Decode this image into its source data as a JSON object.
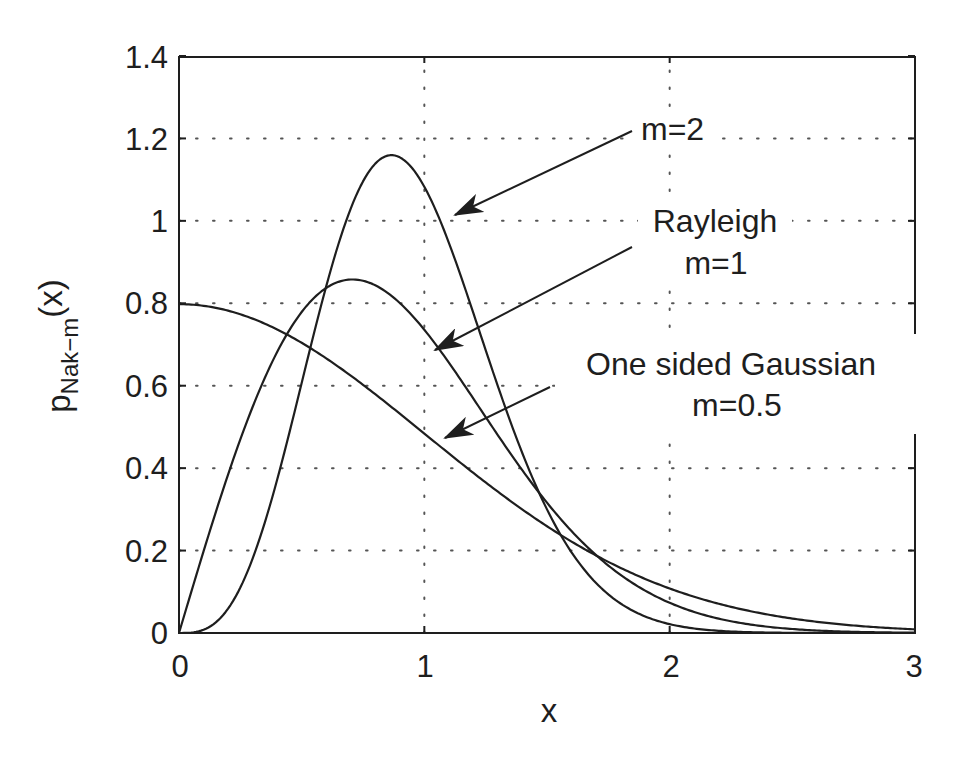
{
  "chart_data": {
    "type": "line",
    "title": "",
    "xlabel": "x",
    "ylabel": "p_Nak-m(x)",
    "ylabel_parts": {
      "main": "p",
      "sub": "Nak−m",
      "arg": "(x)"
    },
    "xlim": [
      0,
      3
    ],
    "ylim": [
      0,
      1.4
    ],
    "xticks": [
      0,
      1,
      2,
      3
    ],
    "xtick_labels": [
      "0",
      "1",
      "2",
      "3"
    ],
    "yticks": [
      0,
      0.2,
      0.4,
      0.6,
      0.8,
      1,
      1.2,
      1.4
    ],
    "ytick_labels": [
      "0",
      "0.2",
      "0.4",
      "0.6",
      "0.8",
      "1",
      "1.2",
      "1.4"
    ],
    "grid": true,
    "grid_style": "dotted",
    "legend": "none (inline annotations with arrows)",
    "line_color": "#1e1e1e",
    "series": [
      {
        "name": "m=2",
        "m": 2,
        "formula": "2*m^m/Gamma(m) * x^(2m-1) * exp(-m*x^2)",
        "x": [
          0,
          0.25,
          0.5,
          0.75,
          0.866,
          1.0,
          1.25,
          1.5,
          1.75,
          2.0,
          2.5,
          3.0
        ],
        "values": [
          0,
          0.11,
          0.607,
          1.115,
          1.159,
          1.083,
          0.696,
          0.3,
          0.084,
          0.015,
          0.0001,
          0.0
        ]
      },
      {
        "name": "Rayleigh m=1",
        "m": 1,
        "formula": "2*x*exp(-x^2)",
        "x": [
          0,
          0.25,
          0.5,
          0.707,
          1.0,
          1.25,
          1.5,
          1.75,
          2.0,
          2.5,
          3.0
        ],
        "values": [
          0,
          0.47,
          0.779,
          0.858,
          0.736,
          0.524,
          0.316,
          0.164,
          0.073,
          0.01,
          0.0007
        ]
      },
      {
        "name": "One sided Gaussian m=0.5",
        "m": 0.5,
        "formula": "sqrt(2/pi)*exp(-x^2/2)",
        "x": [
          0,
          0.25,
          0.5,
          0.75,
          1.0,
          1.25,
          1.5,
          1.75,
          2.0,
          2.5,
          3.0
        ],
        "values": [
          0.798,
          0.773,
          0.704,
          0.602,
          0.484,
          0.365,
          0.259,
          0.173,
          0.108,
          0.035,
          0.009
        ]
      }
    ],
    "annotations": [
      {
        "id": "m2",
        "lines": [
          "m=2"
        ],
        "arrow_from": [
          632,
          131
        ],
        "arrow_to": [
          455,
          215
        ]
      },
      {
        "id": "rayleigh",
        "lines": [
          "Rayleigh",
          "m=1"
        ],
        "arrow_from": [
          632,
          247
        ],
        "arrow_to": [
          435,
          350
        ]
      },
      {
        "id": "gaussian",
        "lines": [
          "One sided Gaussian",
          "m=0.5"
        ],
        "arrow_from": [
          550,
          387
        ],
        "arrow_to": [
          445,
          438
        ]
      }
    ]
  },
  "labels": {
    "xlabel": "x",
    "ylabel_main": "p",
    "ylabel_sub": "Nak−m",
    "ylabel_arg": "(x)",
    "annot_m2": "m=2",
    "annot_rayleigh_1": "Rayleigh",
    "annot_rayleigh_2": "m=1",
    "annot_gauss_1": "One sided Gaussian",
    "annot_gauss_2": "m=0.5",
    "xtick_0": "0",
    "xtick_1": "1",
    "xtick_2": "2",
    "xtick_3": "3",
    "ytick_0": "0",
    "ytick_02": "0.2",
    "ytick_04": "0.4",
    "ytick_06": "0.6",
    "ytick_08": "0.8",
    "ytick_1": "1",
    "ytick_12": "1.2",
    "ytick_14": "1.4"
  }
}
